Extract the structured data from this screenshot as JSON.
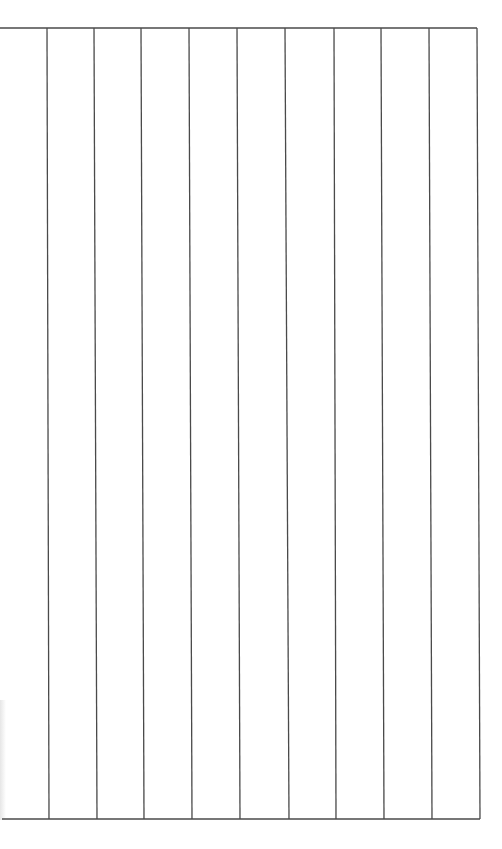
{
  "sheet": {
    "description": "Blank ruled sheet with vertical columns",
    "line_color": "#4a4a4a",
    "line_width": 1.3,
    "top_border": {
      "x1": 0,
      "y1": 28,
      "x2": 477,
      "y2": 28
    },
    "bottom_border": {
      "x1": 2,
      "y1": 819,
      "x2": 480,
      "y2": 819
    },
    "column_count": 10,
    "vertical_lines": [
      {
        "x_top": 47,
        "x_bottom": 49
      },
      {
        "x_top": 94,
        "x_bottom": 97
      },
      {
        "x_top": 141,
        "x_bottom": 144
      },
      {
        "x_top": 189,
        "x_bottom": 192
      },
      {
        "x_top": 237,
        "x_bottom": 240
      },
      {
        "x_top": 285,
        "x_bottom": 289
      },
      {
        "x_top": 334,
        "x_bottom": 336
      },
      {
        "x_top": 381,
        "x_bottom": 384
      },
      {
        "x_top": 429,
        "x_bottom": 432
      },
      {
        "x_top": 477,
        "x_bottom": 480
      }
    ]
  }
}
